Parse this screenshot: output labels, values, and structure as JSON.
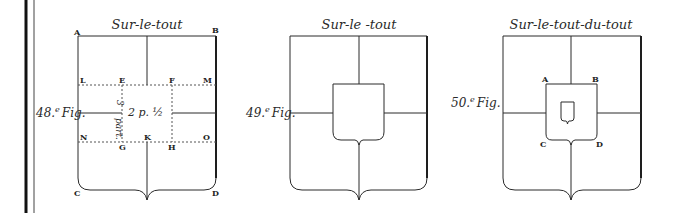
{
  "figures": [
    {
      "id": "fig48",
      "title": "Sur-le-tout",
      "label": "48.",
      "label_sup": "e",
      "label_suffix": "Fig.",
      "points": {
        "A": "A",
        "B": "B",
        "C": "C",
        "D": "D",
        "E": "E",
        "F": "F",
        "G": "G",
        "H": "H",
        "K": "K",
        "L": "L",
        "M": "M",
        "N": "N",
        "O": "O"
      },
      "measure_center": "2 p. ½",
      "measure_side_top": "3",
      "measure_side_bottom": "part."
    },
    {
      "id": "fig49",
      "title": "Sur-le -tout",
      "label": "49.",
      "label_sup": "e",
      "label_suffix": "Fig."
    },
    {
      "id": "fig50",
      "title": "Sur-le-tout-du-tout",
      "label": "50.",
      "label_sup": "e",
      "label_suffix": "Fig.",
      "points": {
        "A": "A",
        "B": "B",
        "C": "C",
        "D": "D"
      }
    }
  ]
}
